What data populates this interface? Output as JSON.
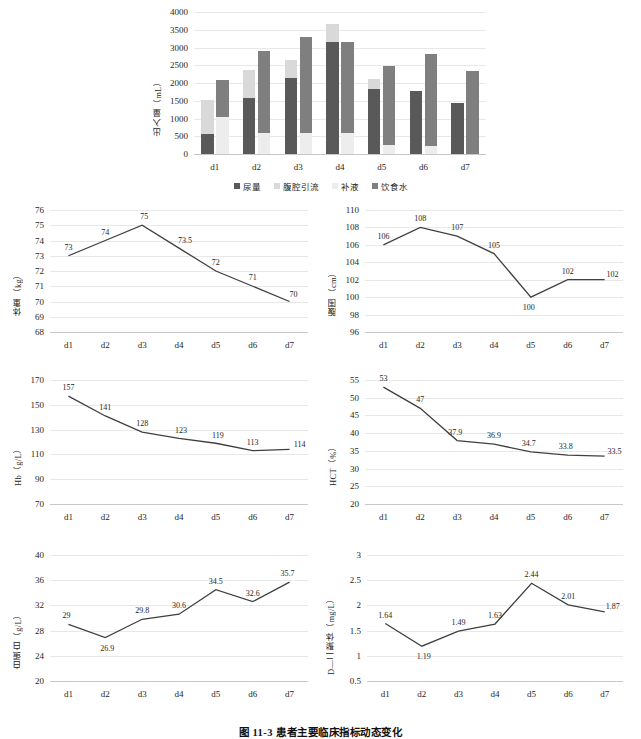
{
  "figure": {
    "caption": "图 11-3  患者主要临床指标动态变化",
    "categories": [
      "d1",
      "d2",
      "d3",
      "d4",
      "d5",
      "d6",
      "d7"
    ],
    "colors": {
      "dark": "#595959",
      "mid": "#7f7f7f",
      "light": "#d9d9d9",
      "pale": "#ededed",
      "line": "#404040",
      "grid": "#e8e8e8"
    }
  },
  "chart_data": [
    {
      "id": "intake-output",
      "type": "bar",
      "stacked": true,
      "grouped": true,
      "title": "",
      "xlabel": "",
      "ylabel": "出入量（mL）",
      "categories": [
        "d1",
        "d2",
        "d3",
        "d4",
        "d5",
        "d6",
        "d7"
      ],
      "ylim": [
        0,
        4000
      ],
      "yticks": [
        0,
        500,
        1000,
        1500,
        2000,
        2500,
        3000,
        3500,
        4000
      ],
      "legend": [
        "尿量",
        "腹腔引流",
        "补液",
        "饮食水"
      ],
      "legend_position": "bottom",
      "grid": true,
      "series": [
        {
          "name": "尿量",
          "stack": "output",
          "values": [
            550,
            1580,
            2150,
            3150,
            1820,
            1770,
            1430
          ]
        },
        {
          "name": "腹腔引流",
          "stack": "output",
          "values": [
            980,
            800,
            500,
            500,
            290,
            0,
            0
          ]
        },
        {
          "name": "补液",
          "stack": "intake",
          "values": [
            1050,
            580,
            580,
            590,
            240,
            230,
            0
          ]
        },
        {
          "name": "饮食水",
          "stack": "intake",
          "values": [
            1030,
            2310,
            2720,
            2560,
            2250,
            2590,
            2350
          ]
        }
      ]
    },
    {
      "id": "weight",
      "type": "line",
      "ylabel": "体重（kg）",
      "xlabel": "",
      "categories": [
        "d1",
        "d2",
        "d3",
        "d4",
        "d5",
        "d6",
        "d7"
      ],
      "values": [
        73,
        74,
        75,
        73.5,
        72,
        71,
        70
      ],
      "labels": [
        "73",
        "74",
        "75",
        "73.5",
        "72",
        "71",
        "70"
      ],
      "ylim": [
        68,
        76
      ],
      "yticks": [
        68,
        69,
        70,
        71,
        72,
        73,
        74,
        75,
        76
      ],
      "grid": true
    },
    {
      "id": "abdominal-girth",
      "type": "line",
      "ylabel": "腹围（cm）",
      "xlabel": "",
      "categories": [
        "d1",
        "d2",
        "d3",
        "d4",
        "d5",
        "d6",
        "d7"
      ],
      "values": [
        106,
        108,
        107,
        105,
        100,
        102,
        102
      ],
      "labels": [
        "106",
        "108",
        "107",
        "105",
        "100",
        "102",
        "102"
      ],
      "ylim": [
        96,
        110
      ],
      "yticks": [
        96,
        98,
        100,
        102,
        104,
        106,
        108,
        110
      ],
      "grid": true
    },
    {
      "id": "hemoglobin",
      "type": "line",
      "ylabel": "Hb（g/L）",
      "xlabel": "",
      "categories": [
        "d1",
        "d2",
        "d3",
        "d4",
        "d5",
        "d6",
        "d7"
      ],
      "values": [
        157,
        141,
        128,
        123,
        119,
        113,
        114
      ],
      "labels": [
        "157",
        "141",
        "128",
        "123",
        "119",
        "113",
        "114"
      ],
      "ylim": [
        70,
        170
      ],
      "yticks": [
        70,
        90,
        110,
        130,
        150,
        170
      ],
      "grid": true
    },
    {
      "id": "hematocrit",
      "type": "line",
      "ylabel": "HCT（%）",
      "xlabel": "",
      "categories": [
        "d1",
        "d2",
        "d3",
        "d4",
        "d5",
        "d6",
        "d7"
      ],
      "values": [
        53,
        47,
        37.9,
        36.9,
        34.7,
        33.8,
        33.5
      ],
      "labels": [
        "53",
        "47",
        "37.9",
        "36.9",
        "34.7",
        "33.8",
        "33.5"
      ],
      "ylim": [
        20,
        55
      ],
      "yticks": [
        20,
        25,
        30,
        35,
        40,
        45,
        50,
        55
      ],
      "grid": true
    },
    {
      "id": "albumin",
      "type": "line",
      "ylabel": "白蛋白（g/L）",
      "xlabel": "",
      "categories": [
        "d1",
        "d2",
        "d3",
        "d4",
        "d5",
        "d6",
        "d7"
      ],
      "values": [
        29,
        26.9,
        29.8,
        30.6,
        34.5,
        32.6,
        35.7
      ],
      "labels": [
        "29",
        "26.9",
        "29.8",
        "30.6",
        "34.5",
        "32.6",
        "35.7"
      ],
      "ylim": [
        20,
        40
      ],
      "yticks": [
        20,
        24,
        28,
        32,
        36,
        40
      ],
      "grid": true
    },
    {
      "id": "d-dimer",
      "type": "line",
      "ylabel": "D—二聚体（mg/L）",
      "xlabel": "",
      "categories": [
        "d1",
        "d2",
        "d3",
        "d4",
        "d5",
        "d6",
        "d7"
      ],
      "values": [
        1.64,
        1.19,
        1.49,
        1.63,
        2.44,
        2.01,
        1.87
      ],
      "labels": [
        "1.64",
        "1.19",
        "1.49",
        "1.63",
        "2.44",
        "2.01",
        "1.87"
      ],
      "ylim": [
        0.5,
        3
      ],
      "yticks": [
        0.5,
        1,
        1.5,
        2,
        2.5,
        3
      ],
      "grid": true
    }
  ]
}
